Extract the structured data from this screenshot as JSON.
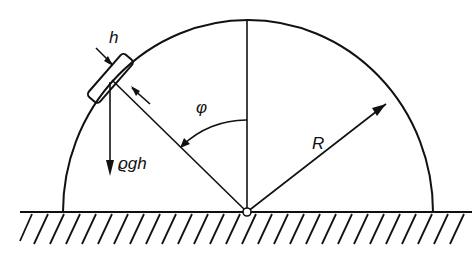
{
  "diagram": {
    "labels": {
      "thickness": "h",
      "weight": "ϱgh",
      "angle": "φ",
      "radius": "R"
    },
    "colors": {
      "stroke": "#111111",
      "background": "#ffffff"
    }
  }
}
